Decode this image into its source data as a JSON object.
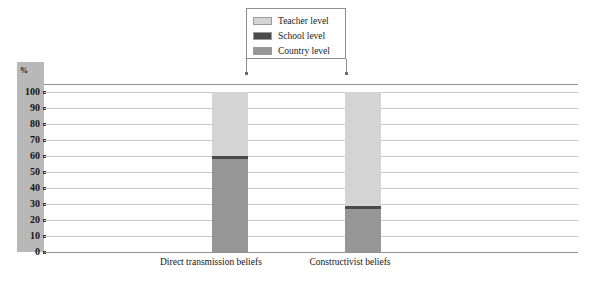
{
  "chart_data": {
    "type": "bar",
    "subtype": "stacked-100-percent",
    "title": "",
    "xlabel": "",
    "ylabel": "%",
    "ylim": [
      0,
      100
    ],
    "ytick_step": 10,
    "yticks": [
      100,
      90,
      80,
      70,
      60,
      50,
      40,
      30,
      20,
      10,
      0
    ],
    "grid": true,
    "legend_position": "top-center",
    "categories": [
      "Direct transmission beliefs",
      "Constructivist beliefs"
    ],
    "series": [
      {
        "name": "Teacher level",
        "color": "#d4d4d4",
        "values": [
          40,
          71
        ]
      },
      {
        "name": "School level",
        "color": "#4a4a4a",
        "values": [
          2,
          2
        ]
      },
      {
        "name": "Country level",
        "color": "#969696",
        "values": [
          58,
          27
        ]
      }
    ],
    "stack_order_bottom_to_top": [
      "Country level",
      "School level",
      "Teacher level"
    ],
    "annotations": []
  },
  "legend": {
    "items": [
      {
        "label": "Teacher level",
        "color": "#d4d4d4"
      },
      {
        "label": "School level",
        "color": "#4a4a4a"
      },
      {
        "label": "Country level",
        "color": "#969696"
      }
    ]
  },
  "axis": {
    "unit_label": "%",
    "ticks": [
      "100",
      "90",
      "80",
      "70",
      "60",
      "50",
      "40",
      "30",
      "20",
      "10",
      "0"
    ]
  }
}
